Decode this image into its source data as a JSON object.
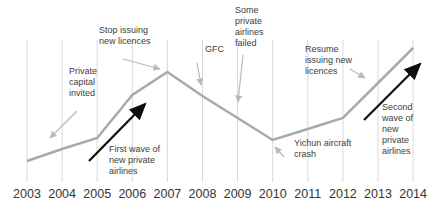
{
  "chart_data": {
    "type": "line",
    "title": "",
    "xlabel": "",
    "ylabel": "",
    "x": [
      2003,
      2004,
      2005,
      2006,
      2007,
      2008,
      2009,
      2010,
      2011,
      2012,
      2013,
      2014
    ],
    "series": [
      {
        "name": "private-airline-activity-trend",
        "values": [
          21,
          33,
          44,
          87,
          110,
          86,
          64,
          42,
          53,
          64,
          99,
          134
        ]
      }
    ],
    "ylim": [
      0,
      150
    ],
    "y_axis_visible": false,
    "grid": "vertical-only",
    "legend": "none",
    "annotations": [
      {
        "id": "private-capital",
        "text": "Private\ncapital\ninvited",
        "arrow": "gray",
        "points_to": "line near 2004"
      },
      {
        "id": "stop-issuing",
        "text": "Stop issuing\nnew licences",
        "arrow": "gray",
        "points_to": "2007 peak"
      },
      {
        "id": "gfc",
        "text": "GFC",
        "arrow": "gray",
        "points_to": "line at 2008"
      },
      {
        "id": "airlines-failed",
        "text": "Some\nprivate\nairlines\nfailed",
        "arrow": "gray",
        "points_to": "line at 2009"
      },
      {
        "id": "resume-issuing",
        "text": "Resume\nissuing new\nlicences",
        "arrow": "gray",
        "points_to": "line at 2013"
      },
      {
        "id": "yichun-crash",
        "text": "Yichun aircraft\ncrash",
        "arrow": "gray",
        "points_to": "2010 trough"
      },
      {
        "id": "first-wave",
        "text": "First wave of\nnew private\nairlines",
        "arrow": "black",
        "points_to": "rise 2005-2007"
      },
      {
        "id": "second-wave",
        "text": "Second\nwave of\nnew\nprivate\nairlines",
        "arrow": "black",
        "points_to": "rise 2012-2014"
      }
    ],
    "colors": {
      "trend_line": "#a9a9a9",
      "gridlines": "#d9d9d9",
      "gray_arrows": "#b9b9b9",
      "black_arrows": "#0d0d0d",
      "annotation_text": "#3d3d3d",
      "tick_text": "#353535",
      "background": "#ffffff"
    }
  }
}
